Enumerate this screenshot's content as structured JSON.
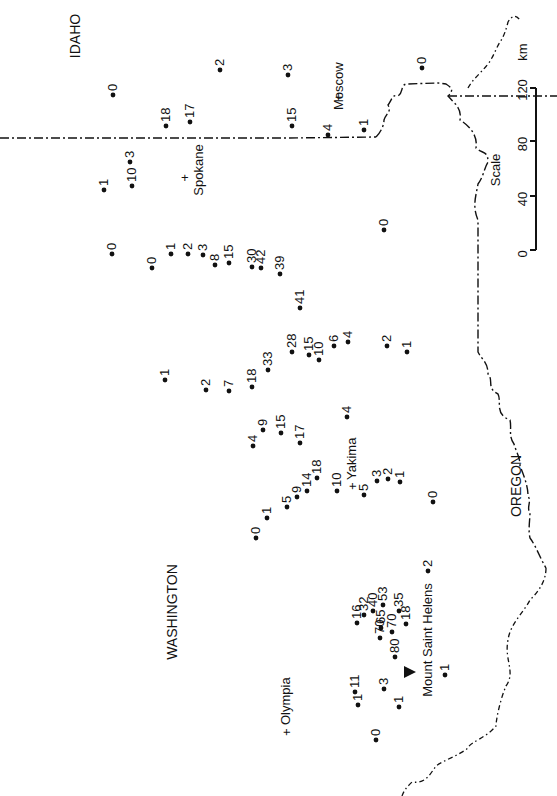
{
  "map": {
    "orientation": "rotated 90 degrees counter-clockwise",
    "states": [
      {
        "label": "WASHINGTON",
        "x": 172,
        "y": 612
      },
      {
        "label": "IDAHO",
        "x": 75,
        "y": 36
      },
      {
        "label": "OREGON",
        "x": 516,
        "y": 486
      }
    ],
    "cities": [
      {
        "label": "Spokane",
        "x": 192,
        "y": 170,
        "marker_x": 185,
        "marker_y": 178
      },
      {
        "label": "Moscow",
        "x": 338,
        "y": 86,
        "marker_x": 338,
        "marker_y": 92
      },
      {
        "label": "Yakima",
        "x": 352,
        "y": 456,
        "marker_x": 354,
        "marker_y": 460
      },
      {
        "label": "Olympia",
        "x": 285,
        "y": 730,
        "marker_x": 285,
        "marker_y": 736
      }
    ],
    "volcano": {
      "label": "Mount Saint Helens",
      "x": 432,
      "y": 640,
      "marker_x": 410,
      "marker_y": 673
    },
    "scale": {
      "label": "Scale",
      "unit": "km",
      "ticks": [
        "0",
        "40",
        "80",
        "120"
      ]
    },
    "stations": [
      {
        "v": "0",
        "x": 113,
        "y": 95
      },
      {
        "v": "1",
        "x": 104,
        "y": 190
      },
      {
        "v": "2",
        "x": 220,
        "y": 70
      },
      {
        "v": "3",
        "x": 130,
        "y": 162
      },
      {
        "v": "10",
        "x": 132,
        "y": 186
      },
      {
        "v": "18",
        "x": 166,
        "y": 126
      },
      {
        "v": "17",
        "x": 190,
        "y": 122
      },
      {
        "v": "3",
        "x": 288,
        "y": 75
      },
      {
        "v": "15",
        "x": 292,
        "y": 126
      },
      {
        "v": "4",
        "x": 328,
        "y": 135
      },
      {
        "v": "1",
        "x": 364,
        "y": 130
      },
      {
        "v": "0",
        "x": 422,
        "y": 68
      },
      {
        "v": "0",
        "x": 384,
        "y": 230
      },
      {
        "v": "0",
        "x": 112,
        "y": 254
      },
      {
        "v": "0",
        "x": 152,
        "y": 268
      },
      {
        "v": "1",
        "x": 171,
        "y": 254
      },
      {
        "v": "2",
        "x": 188,
        "y": 254
      },
      {
        "v": "3",
        "x": 203,
        "y": 255
      },
      {
        "v": "8",
        "x": 215,
        "y": 265
      },
      {
        "v": "15",
        "x": 229,
        "y": 263
      },
      {
        "v": "30",
        "x": 252,
        "y": 267
      },
      {
        "v": "42",
        "x": 261,
        "y": 268
      },
      {
        "v": "39",
        "x": 280,
        "y": 274
      },
      {
        "v": "41",
        "x": 300,
        "y": 308
      },
      {
        "v": "1",
        "x": 165,
        "y": 380
      },
      {
        "v": "2",
        "x": 206,
        "y": 390
      },
      {
        "v": "7",
        "x": 229,
        "y": 391
      },
      {
        "v": "18",
        "x": 252,
        "y": 387
      },
      {
        "v": "33",
        "x": 268,
        "y": 370
      },
      {
        "v": "28",
        "x": 292,
        "y": 352
      },
      {
        "v": "15",
        "x": 309,
        "y": 355
      },
      {
        "v": "10",
        "x": 319,
        "y": 360
      },
      {
        "v": "6",
        "x": 334,
        "y": 346
      },
      {
        "v": "4",
        "x": 348,
        "y": 342
      },
      {
        "v": "2",
        "x": 387,
        "y": 346
      },
      {
        "v": "1",
        "x": 407,
        "y": 352
      },
      {
        "v": "4",
        "x": 253,
        "y": 446
      },
      {
        "v": "9",
        "x": 263,
        "y": 430
      },
      {
        "v": "15",
        "x": 281,
        "y": 433
      },
      {
        "v": "17",
        "x": 300,
        "y": 443
      },
      {
        "v": "4",
        "x": 347,
        "y": 417
      },
      {
        "v": "0",
        "x": 256,
        "y": 538
      },
      {
        "v": "1",
        "x": 267,
        "y": 518
      },
      {
        "v": "5",
        "x": 287,
        "y": 507
      },
      {
        "v": "9",
        "x": 297,
        "y": 497
      },
      {
        "v": "14",
        "x": 307,
        "y": 491
      },
      {
        "v": "18",
        "x": 317,
        "y": 478
      },
      {
        "v": "10",
        "x": 337,
        "y": 491
      },
      {
        "v": "5",
        "x": 364,
        "y": 495
      },
      {
        "v": "3",
        "x": 377,
        "y": 481
      },
      {
        "v": "2",
        "x": 388,
        "y": 479
      },
      {
        "v": "1",
        "x": 400,
        "y": 482
      },
      {
        "v": "0",
        "x": 433,
        "y": 502
      },
      {
        "v": "2",
        "x": 428,
        "y": 571
      },
      {
        "v": "16",
        "x": 357,
        "y": 623
      },
      {
        "v": "32",
        "x": 364,
        "y": 615
      },
      {
        "v": "40",
        "x": 373,
        "y": 611
      },
      {
        "v": "53",
        "x": 383,
        "y": 605
      },
      {
        "v": "35",
        "x": 399,
        "y": 611
      },
      {
        "v": "18",
        "x": 406,
        "y": 624
      },
      {
        "v": "65",
        "x": 381,
        "y": 628
      },
      {
        "v": "70",
        "x": 380,
        "y": 638
      },
      {
        "v": "70",
        "x": 392,
        "y": 632
      },
      {
        "v": "80",
        "x": 395,
        "y": 657
      },
      {
        "v": "11",
        "x": 355,
        "y": 692
      },
      {
        "v": "1",
        "x": 358,
        "y": 705
      },
      {
        "v": "3",
        "x": 384,
        "y": 689
      },
      {
        "v": "1",
        "x": 399,
        "y": 707
      },
      {
        "v": "1",
        "x": 445,
        "y": 675
      },
      {
        "v": "0",
        "x": 376,
        "y": 740
      }
    ]
  }
}
